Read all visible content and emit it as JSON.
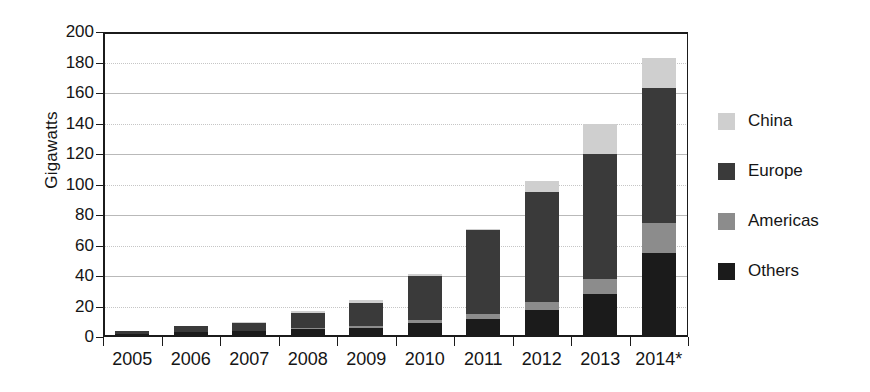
{
  "chart_data": {
    "type": "bar",
    "stacked": true,
    "title": "",
    "xlabel": "",
    "ylabel": "Gigawatts",
    "ylim": [
      0,
      200
    ],
    "ytick_step": 20,
    "yticks": [
      0,
      20,
      40,
      60,
      80,
      100,
      120,
      140,
      160,
      180,
      200
    ],
    "grid": true,
    "legend_position": "right",
    "categories": [
      "2005",
      "2006",
      "2007",
      "2008",
      "2009",
      "2010",
      "2011",
      "2012",
      "2013",
      "2014*"
    ],
    "stack_order_bottom_to_top": [
      "Others",
      "Americas",
      "Europe",
      "China"
    ],
    "series": [
      {
        "name": "Others",
        "color": "#1b1b1b",
        "values": [
          2,
          3,
          4,
          5,
          6,
          9,
          12,
          18,
          28,
          55
        ]
      },
      {
        "name": "Americas",
        "color": "#8c8c8c",
        "values": [
          0,
          0,
          0,
          1,
          1,
          2,
          3,
          5,
          10,
          20
        ]
      },
      {
        "name": "Europe",
        "color": "#3a3a3a",
        "values": [
          2,
          4,
          5,
          10,
          15,
          29,
          55,
          72,
          82,
          88
        ]
      },
      {
        "name": "China",
        "color": "#cfcfcf",
        "values": [
          0,
          0,
          1,
          1,
          2,
          1,
          1,
          7,
          20,
          20
        ]
      }
    ],
    "totals": [
      4,
      7,
      10,
      17,
      24,
      41,
      71,
      102,
      140,
      183
    ]
  },
  "legend": {
    "items": [
      {
        "label": "China",
        "color": "#cfcfcf"
      },
      {
        "label": "Europe",
        "color": "#3a3a3a"
      },
      {
        "label": "Americas",
        "color": "#8c8c8c"
      },
      {
        "label": "Others",
        "color": "#1b1b1b"
      }
    ]
  }
}
